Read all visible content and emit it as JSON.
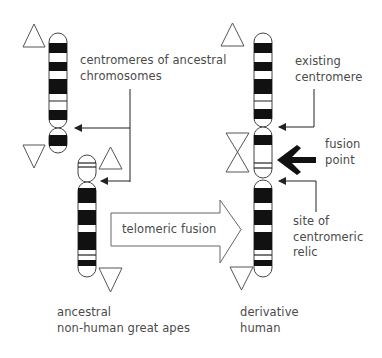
{
  "labels": {
    "centromeres_ancestral": [
      "centromeres of ancestral",
      "chromosomes"
    ],
    "existing_centromere": [
      "existing",
      "centromere"
    ],
    "fusion_point": [
      "fusion",
      "point"
    ],
    "site_relic": [
      "site of",
      "centromeric",
      "relic"
    ],
    "telomeric_fusion": "telomeric fusion",
    "ancestral_apes": [
      "ancestral",
      "non-human great apes"
    ],
    "derivative_human": [
      "derivative",
      "human"
    ]
  },
  "colors": {
    "band": "#111111",
    "outline": "#444444",
    "triangle": "#555555",
    "text": "#4a4a4a"
  },
  "elements": {
    "ancestral_chromosomes": 2,
    "derivative_chromosomes": 1,
    "telomere_markers": "triangle-icon",
    "fusion_marker": "hourglass-icon"
  }
}
